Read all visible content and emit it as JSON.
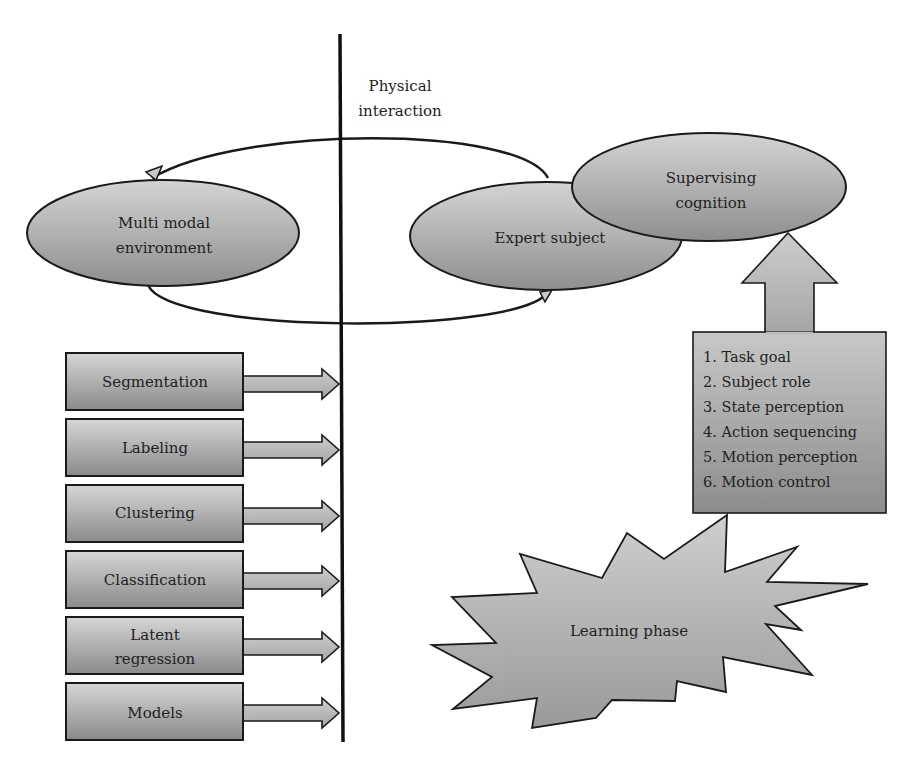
{
  "divider": {
    "label_line1": "Physical",
    "label_line2": "interaction"
  },
  "ellipses": {
    "environment": {
      "line1": "Multi modal",
      "line2": "environment"
    },
    "expert": {
      "line1": "Expert subject"
    },
    "supervising": {
      "line1": "Supervising",
      "line2": "cognition"
    }
  },
  "process_boxes": [
    {
      "line1": "Segmentation",
      "line2": ""
    },
    {
      "line1": "Labeling",
      "line2": ""
    },
    {
      "line1": "Clustering",
      "line2": ""
    },
    {
      "line1": "Classification",
      "line2": ""
    },
    {
      "line1": "Latent",
      "line2": "regression"
    },
    {
      "line1": "Models",
      "line2": ""
    }
  ],
  "cognition_list": [
    "1. Task goal",
    "2. Subject role",
    "3. State perception",
    "4. Action sequencing",
    "5. Motion perception",
    "6. Motion control"
  ],
  "learning": {
    "label": "Learning phase"
  },
  "colors": {
    "shape_light": "#d2d2d2",
    "shape_dark": "#8c8c8c",
    "stroke": "#1a1a1a",
    "text": "#222222"
  }
}
